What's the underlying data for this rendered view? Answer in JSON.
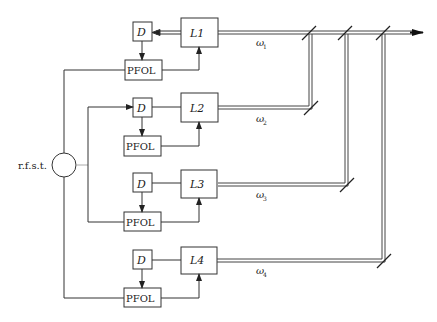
{
  "diagram": {
    "source_label": "r.f.s.t.",
    "channels": [
      {
        "id": 1,
        "laser_label": "L1",
        "detector_label": "D",
        "lock_label": "PFOL",
        "freq_label": "ω",
        "freq_sub": "1"
      },
      {
        "id": 2,
        "laser_label": "L2",
        "detector_label": "D",
        "lock_label": "PFOL",
        "freq_label": "ω",
        "freq_sub": "2"
      },
      {
        "id": 3,
        "laser_label": "L3",
        "detector_label": "D",
        "lock_label": "PFOL",
        "freq_label": "ω",
        "freq_sub": "3"
      },
      {
        "id": 4,
        "laser_label": "L4",
        "detector_label": "D",
        "lock_label": "PFOL",
        "freq_label": "ω",
        "freq_sub": "4"
      }
    ],
    "colors": {
      "line": "#333333",
      "background": "#ffffff"
    }
  }
}
